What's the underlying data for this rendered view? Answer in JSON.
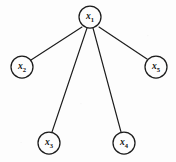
{
  "diagram": {
    "type": "graph",
    "background_color": "#fdfdfd",
    "stroke_color": "#1c1c1c",
    "node_radius": 11,
    "nodes": [
      {
        "id": "x1",
        "label_base": "x",
        "label_sub": "1",
        "cx": 90,
        "cy": 17,
        "r": 11,
        "role": "root"
      },
      {
        "id": "x2",
        "label_base": "x",
        "label_sub": "2",
        "cx": 22,
        "cy": 67,
        "r": 11,
        "role": "leaf"
      },
      {
        "id": "x3",
        "label_base": "x",
        "label_sub": "3",
        "cx": 49,
        "cy": 143,
        "r": 11,
        "role": "leaf"
      },
      {
        "id": "x4",
        "label_base": "x",
        "label_sub": "4",
        "cx": 124,
        "cy": 143,
        "r": 11,
        "role": "leaf"
      },
      {
        "id": "x5",
        "label_base": "x",
        "label_sub": "5",
        "cx": 156,
        "cy": 67,
        "r": 11,
        "role": "leaf"
      }
    ],
    "edges": [
      {
        "id": "edge-x1-x2",
        "from": "x1",
        "to": "x2",
        "x1": 82,
        "y1": 27,
        "x2": 31,
        "y2": 60
      },
      {
        "id": "edge-x1-x3",
        "from": "x1",
        "to": "x3",
        "x1": 87,
        "y1": 28,
        "x2": 52,
        "y2": 132
      },
      {
        "id": "edge-x1-x4",
        "from": "x1",
        "to": "x4",
        "x1": 93,
        "y1": 28,
        "x2": 121,
        "y2": 132
      },
      {
        "id": "edge-x1-x5",
        "from": "x1",
        "to": "x5",
        "x1": 99,
        "y1": 27,
        "x2": 147,
        "y2": 59
      }
    ]
  }
}
